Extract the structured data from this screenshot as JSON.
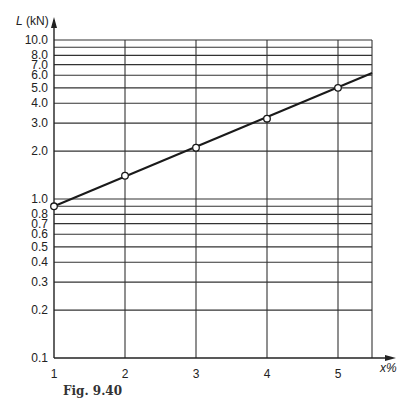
{
  "chart_data": {
    "type": "line",
    "title": "",
    "xlabel": "x%",
    "ylabel": "L (kN)",
    "yscale": "log",
    "xlim": [
      1,
      5.48
    ],
    "ylim": [
      0.1,
      10.0
    ],
    "grid": true,
    "x_ticks": [
      "1",
      "2",
      "3",
      "4",
      "5"
    ],
    "y_ticks": [
      "0.1",
      "0.2",
      "0.3",
      "0.4",
      "0.5",
      "0.6",
      "0.7",
      "0.8",
      "1.0",
      "2.0",
      "3.0",
      "4.0",
      "5.0",
      "6.0",
      "7.0",
      "8.0",
      "10.0"
    ],
    "series": [
      {
        "name": "L vs x%",
        "x": [
          1,
          2,
          3,
          4,
          5
        ],
        "values": [
          0.9,
          1.4,
          2.1,
          3.2,
          5.0
        ],
        "markers": "open-circle",
        "line_extends_to": {
          "x": 5.48,
          "y": 6.2
        }
      }
    ]
  },
  "caption": "Fig. 9.40"
}
